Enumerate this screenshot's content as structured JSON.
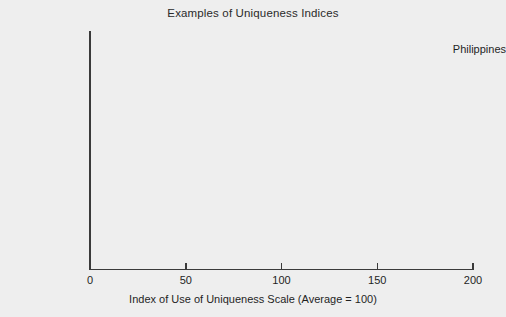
{
  "chart_data": {
    "type": "bar",
    "orientation": "horizontal",
    "title": "Examples of Uniqueness Indices",
    "xlabel": "Index of Use of Uniqueness Scale (Average = 100)",
    "ylabel": "",
    "categories": [
      "Philippines",
      "Italy",
      "U.S.",
      "U.K.",
      "Sweden",
      "Hong Kong",
      "Japan"
    ],
    "values": [
      179,
      100,
      163,
      154,
      96,
      58,
      38
    ],
    "value_labels": [
      "179",
      "100",
      "163",
      "154",
      "96",
      "58",
      "38"
    ],
    "xlim": [
      0,
      200
    ],
    "xticks": [
      0,
      50,
      100,
      150,
      200
    ],
    "xtick_labels": [
      "0",
      "50",
      "100",
      "150",
      "200"
    ],
    "grid": false,
    "legend": "none",
    "bar_colors": [
      {
        "from": "#b4b4b4",
        "to": "#808080"
      },
      {
        "from": "#c9c9c9",
        "to": "#949494"
      },
      {
        "from": "#6e6e6e",
        "to": "#2a2a2a"
      },
      {
        "from": "#3a3a3a",
        "to": "#121212"
      },
      {
        "from": "#8a8a8a",
        "to": "#5e5e5e"
      },
      {
        "from": "#6a6a6a",
        "to": "#2e2e2e"
      },
      {
        "from": "#bcbcbc",
        "to": "#9a9a9a"
      }
    ],
    "background_color": "#eeeeee",
    "axis_color": "#3a3a3a",
    "text_color": "#1f1f1f"
  }
}
